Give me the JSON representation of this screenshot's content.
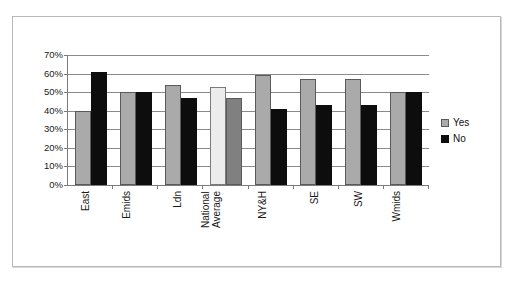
{
  "title_strip": "                 ",
  "legend": {
    "position": "right",
    "items": [
      {
        "label": "Yes",
        "color": "#aaaaaa",
        "key": "yes"
      },
      {
        "label": "No",
        "color": "#0d0d0d",
        "key": "no"
      }
    ]
  },
  "axis": {
    "y_ticks": [
      "0%",
      "10%",
      "20%",
      "30%",
      "40%",
      "50%",
      "60%",
      "70%"
    ],
    "y_tick_values": [
      0,
      10,
      20,
      30,
      40,
      50,
      60,
      70
    ]
  },
  "chart_data": {
    "type": "bar",
    "title": "",
    "xlabel": "",
    "ylabel": "",
    "ylim": [
      0,
      70
    ],
    "ytick_format": "percent",
    "ytick_step": 10,
    "grid": true,
    "legend_position": "right",
    "categories": [
      "East",
      "Emids",
      "Ldn",
      "National Average",
      "NY&H",
      "SE",
      "SW",
      "Wmids"
    ],
    "series": [
      {
        "name": "Yes",
        "color": "#aaaaaa",
        "values": [
          40,
          50,
          54,
          53,
          59,
          57,
          57,
          50
        ]
      },
      {
        "name": "No",
        "color": "#0d0d0d",
        "values": [
          61,
          50,
          47,
          47,
          41,
          43,
          43,
          50
        ]
      }
    ]
  },
  "bars": [
    {
      "category": "East",
      "label_lines": [
        "East"
      ],
      "yes": 40,
      "no": 61,
      "yes_style": "yes",
      "no_style": "no"
    },
    {
      "category": "Emids",
      "label_lines": [
        "Emids"
      ],
      "yes": 50,
      "no": 50,
      "yes_style": "yes",
      "no_style": "no"
    },
    {
      "category": "Ldn",
      "label_lines": [
        "Ldn"
      ],
      "yes": 54,
      "no": 47,
      "yes_style": "yes",
      "no_style": "no"
    },
    {
      "category": "National Average",
      "label_lines": [
        "National",
        "Average"
      ],
      "yes": 53,
      "no": 47,
      "yes_style": "yes-light",
      "no_style": "no-mid"
    },
    {
      "category": "NY&H",
      "label_lines": [
        "NY&H"
      ],
      "yes": 59,
      "no": 41,
      "yes_style": "yes",
      "no_style": "no"
    },
    {
      "category": "SE",
      "label_lines": [
        "SE"
      ],
      "yes": 57,
      "no": 43,
      "yes_style": "yes",
      "no_style": "no"
    },
    {
      "category": "SW",
      "label_lines": [
        "SW"
      ],
      "yes": 57,
      "no": 43,
      "yes_style": "yes",
      "no_style": "no"
    },
    {
      "category": "Wmids",
      "label_lines": [
        "Wmids"
      ],
      "yes": 50,
      "no": 50,
      "yes_style": "yes",
      "no_style": "no"
    }
  ]
}
